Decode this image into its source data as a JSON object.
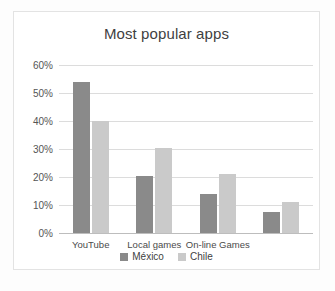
{
  "chart_data": {
    "type": "bar",
    "title": "Most popular apps",
    "xlabel": "",
    "ylabel": "",
    "categories": [
      "YouTube",
      "Local games",
      "On-line Games",
      ""
    ],
    "series": [
      {
        "name": "México",
        "color": "#8a8a8a",
        "values": [
          54,
          20.5,
          14,
          7.5
        ]
      },
      {
        "name": "Chile",
        "color": "#cacaca",
        "values": [
          40,
          30.5,
          21,
          11
        ]
      }
    ],
    "ylim": [
      0,
      60
    ],
    "yticks": [
      "0%",
      "10%",
      "20%",
      "30%",
      "40%",
      "50%",
      "60%"
    ],
    "ytick_values": [
      0,
      10,
      20,
      30,
      40,
      50,
      60
    ],
    "grid": true,
    "legend_position": "bottom"
  }
}
